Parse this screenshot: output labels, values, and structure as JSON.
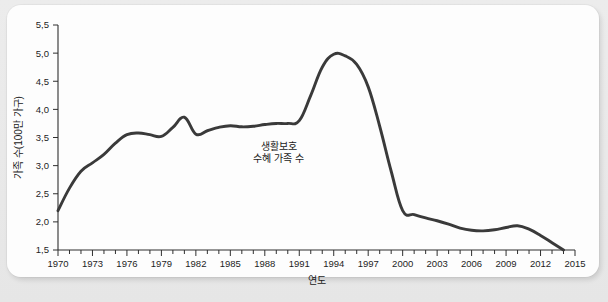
{
  "figure": {
    "background_color": "#e9e9e9",
    "card_color": "#fdfdfd",
    "line_color": "#3a3a3a",
    "axis_color": "#2f2f2f",
    "text_color": "#1a1a1a"
  },
  "chart_data": {
    "type": "line",
    "title": "",
    "xlabel": "연도",
    "ylabel": "가족 수(100만 가구)",
    "xlim": [
      1970,
      2015
    ],
    "ylim": [
      1.5,
      5.5
    ],
    "grid": false,
    "legend_position": "none",
    "y_ticks": [
      "1,5",
      "2,0",
      "2,5",
      "3,0",
      "3,5",
      "4,0",
      "4,5",
      "5,0",
      "5,5"
    ],
    "y_tick_values": [
      1.5,
      2.0,
      2.5,
      3.0,
      3.5,
      4.0,
      4.5,
      5.0,
      5.5
    ],
    "x_ticks": [
      "1970",
      "1973",
      "1976",
      "1979",
      "1982",
      "1985",
      "1988",
      "1991",
      "1994",
      "1997",
      "2000",
      "2003",
      "2006",
      "2009",
      "2012",
      "2015"
    ],
    "x_tick_values": [
      1970,
      1973,
      1976,
      1979,
      1982,
      1985,
      1988,
      1991,
      1994,
      1997,
      2000,
      2003,
      2006,
      2009,
      2012,
      2015
    ],
    "x_minor_tick_step": 1,
    "annotations": [
      {
        "name": "series-label",
        "lines": [
          "생활보호",
          "수혜 가족 수"
        ],
        "x": 1989.2,
        "y": 3.28
      }
    ],
    "series": [
      {
        "name": "생활보호 수혜 가족 수",
        "color": "#3a3a3a",
        "x": [
          1970,
          1971,
          1972,
          1973,
          1974,
          1975,
          1976,
          1977,
          1978,
          1979,
          1980,
          1981,
          1982,
          1983,
          1984,
          1985,
          1986,
          1987,
          1988,
          1989,
          1990,
          1991,
          1992,
          1993,
          1994,
          1995,
          1996,
          1997,
          1998,
          1999,
          2000,
          2001,
          2002,
          2003,
          2004,
          2005,
          2006,
          2007,
          2008,
          2009,
          2010,
          2011,
          2012,
          2013,
          2014
        ],
        "values": [
          2.2,
          2.6,
          2.9,
          3.05,
          3.2,
          3.4,
          3.55,
          3.58,
          3.55,
          3.52,
          3.68,
          3.86,
          3.56,
          3.62,
          3.68,
          3.71,
          3.69,
          3.7,
          3.73,
          3.75,
          3.75,
          3.8,
          4.25,
          4.75,
          4.98,
          4.95,
          4.8,
          4.4,
          3.7,
          2.9,
          2.2,
          2.13,
          2.07,
          2.02,
          1.96,
          1.89,
          1.85,
          1.84,
          1.86,
          1.9,
          1.93,
          1.87,
          1.76,
          1.63,
          1.5
        ]
      }
    ]
  }
}
